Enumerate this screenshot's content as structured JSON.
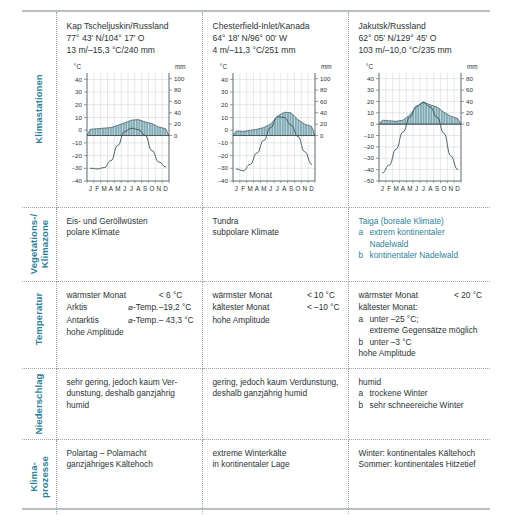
{
  "row_labels": {
    "stations": "Klimastationen",
    "vegetation": "Vegetations-/\nKlimazone",
    "temperature": "Temperatur",
    "precipitation": "Niederschlag",
    "processes": "Klima-\nprozesse"
  },
  "stations": [
    {
      "name": "Kap Tscheljuskin/Russland",
      "coords": "77° 43′ N/104° 17′ O",
      "summary": "13 m/–15,3 °C/240 mm"
    },
    {
      "name": "Chesterfield-Inlet/Kanada",
      "coords": "64° 18′ N/96° 00′ W",
      "summary": "4 m/–11,3 °C/251 mm"
    },
    {
      "name": "Jakutsk/Russland",
      "coords": "62° 05′ N/129° 45′ O",
      "summary": "103 m/–10,0 °C/235 mm"
    }
  ],
  "axis": {
    "temp_unit": "°C",
    "precip_unit": "mm",
    "months": [
      "J",
      "F",
      "M",
      "A",
      "M",
      "J",
      "J",
      "A",
      "S",
      "O",
      "N",
      "D"
    ]
  },
  "chart_data": [
    {
      "type": "line",
      "title": "Kap Tscheljuskin/Russland",
      "xlabel": "",
      "ylabel": "°C",
      "y2label": "mm",
      "categories": [
        "J",
        "F",
        "M",
        "A",
        "M",
        "J",
        "J",
        "A",
        "S",
        "O",
        "N",
        "D"
      ],
      "ylim": [
        -40,
        45
      ],
      "y2lim": [
        -80,
        110
      ],
      "yticks": [
        40,
        30,
        20,
        10,
        0,
        -10,
        -20,
        -30,
        -40
      ],
      "y2ticks": [
        100,
        80,
        60,
        40,
        20,
        0
      ],
      "grid": true,
      "series": [
        {
          "name": "Temperatur (°C)",
          "type": "line",
          "values": [
            -30.0,
            -30.5,
            -29.5,
            -24.0,
            -12.0,
            -1.0,
            1.5,
            0.5,
            -4.0,
            -16.0,
            -25.0,
            -29.0
          ]
        },
        {
          "name": "Niederschlag (mm)",
          "type": "bar",
          "values": [
            11,
            12,
            13,
            14,
            18,
            22,
            27,
            28,
            24,
            21,
            15,
            12
          ]
        }
      ]
    },
    {
      "type": "line",
      "title": "Chesterfield-Inlet/Kanada",
      "xlabel": "",
      "ylabel": "°C",
      "y2label": "mm",
      "categories": [
        "J",
        "F",
        "M",
        "A",
        "M",
        "J",
        "J",
        "A",
        "S",
        "O",
        "N",
        "D"
      ],
      "ylim": [
        -40,
        45
      ],
      "y2lim": [
        -80,
        110
      ],
      "yticks": [
        40,
        30,
        20,
        10,
        0,
        -10,
        -20,
        -30,
        -40
      ],
      "y2ticks": [
        100,
        80,
        60,
        40,
        20,
        0
      ],
      "grid": true,
      "series": [
        {
          "name": "Temperatur (°C)",
          "type": "line",
          "values": [
            -30.5,
            -32.0,
            -27.0,
            -18.0,
            -8.0,
            2.0,
            10.5,
            10.0,
            4.0,
            -5.0,
            -17.0,
            -27.0
          ]
        },
        {
          "name": "Niederschlag (mm)",
          "type": "bar",
          "values": [
            8,
            7,
            9,
            11,
            14,
            20,
            34,
            41,
            40,
            28,
            20,
            16
          ]
        }
      ]
    },
    {
      "type": "line",
      "title": "Jakutsk/Russland",
      "xlabel": "",
      "ylabel": "°C",
      "y2label": "mm",
      "categories": [
        "J",
        "F",
        "M",
        "A",
        "M",
        "J",
        "J",
        "A",
        "S",
        "O",
        "N",
        "D"
      ],
      "ylim": [
        -50,
        45
      ],
      "y2lim": [
        -100,
        90
      ],
      "yticks": [
        40,
        30,
        20,
        10,
        0,
        -10,
        -20,
        -30,
        -40,
        -50
      ],
      "y2ticks": [
        80,
        60,
        40,
        20,
        0
      ],
      "grid": true,
      "series": [
        {
          "name": "Temperatur (°C)",
          "type": "line",
          "values": [
            -43.0,
            -36.0,
            -22.0,
            -7.0,
            6.0,
            16.0,
            19.0,
            15.0,
            6.0,
            -8.0,
            -28.0,
            -40.0
          ]
        },
        {
          "name": "Niederschlag (mm)",
          "type": "bar",
          "values": [
            7,
            6,
            5,
            7,
            16,
            31,
            39,
            34,
            30,
            21,
            14,
            10
          ]
        }
      ]
    }
  ],
  "vegetation": [
    {
      "lines": [
        "Eis- und Geröllwüsten",
        "polare Klimate"
      ],
      "teal": false,
      "items": []
    },
    {
      "lines": [
        "Tundra",
        "subpolare Klimate"
      ],
      "teal": false,
      "items": []
    },
    {
      "lines": [
        "Taiga (boreale Klimate)"
      ],
      "teal": true,
      "items": [
        {
          "mark": "a",
          "text": "extrem kontinentaler Nadelwald"
        },
        {
          "mark": "b",
          "text": "kontinentaler Nadelwald"
        }
      ]
    }
  ],
  "temperature": [
    {
      "rows": [
        {
          "k": "wärmster Monat",
          "k2": "",
          "v": "< 6 °C"
        },
        {
          "k": "Arktis",
          "k2": "⌀-Temp.",
          "v": "–19,2 °C"
        },
        {
          "k": "Antarktis",
          "k2": "⌀-Temp.",
          "v": "– 43,3 °C"
        }
      ],
      "after": [
        "hohe Amplitude"
      ],
      "items": []
    },
    {
      "rows": [
        {
          "k": "wärmster Monat",
          "k2": "",
          "v": "< 10 °C"
        },
        {
          "k": "kältester Monat",
          "k2": "",
          "v": "< –10 °C"
        }
      ],
      "after": [
        "hohe Amplitude"
      ],
      "items": []
    },
    {
      "rows": [
        {
          "k": "wärmster Monat",
          "k2": "",
          "v": "< 20 °C"
        }
      ],
      "before_items": [
        "kältester Monat:"
      ],
      "items": [
        {
          "mark": "a",
          "text": "unter –25 °C;"
        },
        {
          "mark": "",
          "text": "extreme Gegensätze möglich"
        },
        {
          "mark": "b",
          "text": "unter –3 °C"
        }
      ],
      "after": [
        "hohe Amplitude"
      ]
    }
  ],
  "precipitation": [
    {
      "lines": [
        "sehr gering, jedoch kaum Ver-",
        "dunstung, deshalb ganzjährig",
        "humid"
      ],
      "items": []
    },
    {
      "lines": [
        "gering, jedoch kaum Verdunstung,",
        "deshalb ganzjährig humid"
      ],
      "items": []
    },
    {
      "lines": [
        "humid"
      ],
      "items": [
        {
          "mark": "a",
          "text": "trockene Winter"
        },
        {
          "mark": "b",
          "text": "sehr schneereiche Winter"
        }
      ]
    }
  ],
  "processes": [
    {
      "lines": [
        "Polartag – Polarnacht",
        "ganzjähriges Kältehoch"
      ]
    },
    {
      "lines": [
        "extreme Winterkälte",
        "in kontinentaler Lage"
      ]
    },
    {
      "lines": [
        "Winter: kontinentales Kältehoch",
        "Sommer: kontinentales Hitzetief"
      ]
    }
  ],
  "colors": {
    "teal": "#2d7f97",
    "precip_fill": "#7fa9b4",
    "precip_line": "#3d4f55",
    "grid": "#c8cfd3",
    "axis": "#4a5458",
    "text": "#2b3336"
  }
}
